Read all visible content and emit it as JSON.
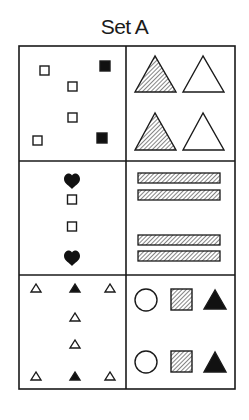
{
  "title": "Set A",
  "colors": {
    "stroke": "#1a1a1a",
    "fill_solid": "#111111",
    "background": "#ffffff"
  },
  "grid": {
    "rows": 3,
    "cols": 2,
    "cells": [
      {
        "row": 0,
        "col": 0,
        "description": "Six small squares: four outlined, two solid black",
        "items": [
          {
            "shape": "square",
            "fill": "outline",
            "x": 42,
            "y": 69
          },
          {
            "shape": "square",
            "fill": "solid",
            "x": 105,
            "y": 66
          },
          {
            "shape": "square",
            "fill": "outline",
            "x": 72,
            "y": 86
          },
          {
            "shape": "square",
            "fill": "outline",
            "x": 72,
            "y": 117
          },
          {
            "shape": "square",
            "fill": "outline",
            "x": 37,
            "y": 140
          },
          {
            "shape": "square",
            "fill": "solid",
            "x": 101,
            "y": 137
          }
        ]
      },
      {
        "row": 0,
        "col": 1,
        "description": "Two rows of triangle pairs: hatched and outlined",
        "items": [
          {
            "shape": "triangle",
            "fill": "hatched",
            "position": "top-left"
          },
          {
            "shape": "triangle",
            "fill": "outline",
            "position": "top-right"
          },
          {
            "shape": "triangle",
            "fill": "hatched",
            "position": "bottom-left"
          },
          {
            "shape": "triangle",
            "fill": "outline",
            "position": "bottom-right"
          }
        ]
      },
      {
        "row": 1,
        "col": 0,
        "description": "Vertical column: heart, square, square, heart",
        "items": [
          {
            "shape": "heart",
            "fill": "solid"
          },
          {
            "shape": "square",
            "fill": "outline"
          },
          {
            "shape": "square",
            "fill": "outline"
          },
          {
            "shape": "heart",
            "fill": "solid"
          }
        ]
      },
      {
        "row": 1,
        "col": 1,
        "description": "Four hatched horizontal bars in two pairs",
        "items": [
          {
            "shape": "bar",
            "fill": "hatched"
          },
          {
            "shape": "bar",
            "fill": "hatched"
          },
          {
            "shape": "bar",
            "fill": "hatched"
          },
          {
            "shape": "bar",
            "fill": "hatched"
          }
        ]
      },
      {
        "row": 2,
        "col": 0,
        "description": "Small triangles: outlined corners, solid center top/bottom, two outlined in middle",
        "items": [
          {
            "shape": "triangle",
            "fill": "outline"
          },
          {
            "shape": "triangle",
            "fill": "solid"
          },
          {
            "shape": "triangle",
            "fill": "outline"
          },
          {
            "shape": "triangle",
            "fill": "outline"
          },
          {
            "shape": "triangle",
            "fill": "outline"
          },
          {
            "shape": "triangle",
            "fill": "outline"
          },
          {
            "shape": "triangle",
            "fill": "solid"
          },
          {
            "shape": "triangle",
            "fill": "outline"
          }
        ]
      },
      {
        "row": 2,
        "col": 1,
        "description": "Two rows of circle, hatched square, solid triangle",
        "items": [
          {
            "shape": "circle",
            "fill": "outline"
          },
          {
            "shape": "square",
            "fill": "hatched"
          },
          {
            "shape": "triangle",
            "fill": "solid"
          },
          {
            "shape": "circle",
            "fill": "outline"
          },
          {
            "shape": "square",
            "fill": "hatched"
          },
          {
            "shape": "triangle",
            "fill": "solid"
          }
        ]
      }
    ]
  }
}
